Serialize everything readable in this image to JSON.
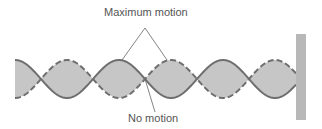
{
  "diagram": {
    "labels": {
      "antinode": "Maximum motion",
      "node": "No motion"
    },
    "colors": {
      "fill": "#c6c6c6",
      "stroke": "#6e6e6e",
      "wall": "#b8b8b8",
      "text": "#555555"
    },
    "wave": {
      "x_start": 15,
      "x_end": 296,
      "center_y": 79,
      "amplitude": 19,
      "half_wavelength": 52,
      "loops": 5.5
    }
  }
}
